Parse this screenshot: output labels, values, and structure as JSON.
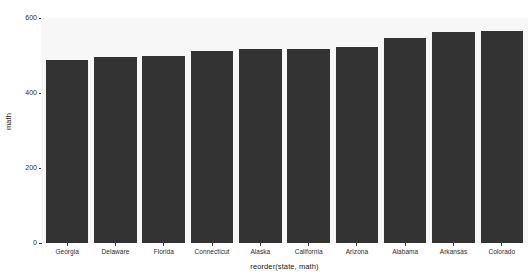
{
  "chart_data": {
    "type": "bar",
    "title": "",
    "xlabel": "reorder(state, math)",
    "ylabel": "math",
    "categories": [
      "Georgia",
      "Delaware",
      "Florida",
      "Connecticut",
      "Alaska",
      "California",
      "Arizona",
      "Alabama",
      "Arkansas",
      "Colorado"
    ],
    "values": [
      489,
      495,
      498,
      512,
      517,
      517,
      523,
      547,
      563,
      565
    ],
    "ylim": [
      0,
      600
    ],
    "yticks": [
      0,
      200,
      400,
      600
    ],
    "ytick_labels": [
      "0",
      "200",
      "400",
      "600"
    ],
    "grid": false,
    "legend": null,
    "bar_color": "#333333",
    "panel_color": "#f7f7f7",
    "background_color": "#ffffff"
  }
}
